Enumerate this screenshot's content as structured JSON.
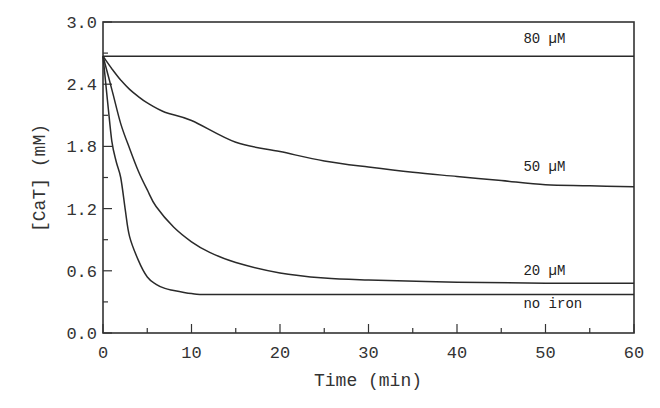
{
  "chart_data": {
    "type": "line",
    "title": "",
    "xlabel": "Time (min)",
    "ylabel": "[CaT] (mM)",
    "xlim": [
      0,
      60
    ],
    "ylim": [
      0.0,
      3.0
    ],
    "xticks": [
      0,
      10,
      20,
      30,
      40,
      50,
      60
    ],
    "xtick_labels": [
      "0",
      "10",
      "20",
      "30",
      "40",
      "50",
      "60"
    ],
    "xminor": [
      5,
      15,
      25,
      35,
      45,
      55
    ],
    "yticks": [
      0.0,
      0.6,
      1.2,
      1.8,
      2.4,
      3.0
    ],
    "ytick_labels": [
      "0.0",
      "0.6",
      "1.2",
      "1.8",
      "2.4",
      "3.0"
    ],
    "yminor": [
      0.3,
      0.9,
      1.5,
      2.1,
      2.7
    ],
    "grid": false,
    "legend": "inline labels at right",
    "series": [
      {
        "name": "80 µM",
        "x": [
          0,
          60
        ],
        "values": [
          2.67,
          2.67
        ]
      },
      {
        "name": "50 µM",
        "x": [
          0,
          1,
          2,
          3,
          4,
          5,
          7,
          10,
          15,
          20,
          25,
          30,
          35,
          40,
          45,
          50,
          55,
          60
        ],
        "values": [
          2.67,
          2.55,
          2.44,
          2.35,
          2.28,
          2.22,
          2.13,
          2.05,
          1.84,
          1.75,
          1.66,
          1.6,
          1.55,
          1.51,
          1.47,
          1.43,
          1.42,
          1.41
        ]
      },
      {
        "name": "20 µM",
        "x": [
          0,
          1,
          2,
          3,
          4,
          5,
          6,
          8,
          10,
          12,
          15,
          20,
          25,
          30,
          40,
          50,
          60
        ],
        "values": [
          2.67,
          2.35,
          2.02,
          1.78,
          1.56,
          1.38,
          1.22,
          1.02,
          0.88,
          0.78,
          0.68,
          0.58,
          0.53,
          0.51,
          0.49,
          0.48,
          0.48
        ]
      },
      {
        "name": "no iron",
        "x": [
          0,
          0.5,
          1,
          1.5,
          2,
          2.5,
          3,
          4,
          5,
          6,
          7,
          8,
          10,
          12,
          20,
          30,
          40,
          50,
          60
        ],
        "values": [
          2.67,
          2.25,
          1.85,
          1.65,
          1.5,
          1.2,
          0.93,
          0.7,
          0.54,
          0.47,
          0.43,
          0.41,
          0.38,
          0.37,
          0.37,
          0.37,
          0.37,
          0.37,
          0.37
        ]
      }
    ],
    "series_label_positions": [
      {
        "name": "80 µM",
        "x_min": 47.5,
        "y_val": 2.8
      },
      {
        "name": "50 µM",
        "x_min": 47.5,
        "y_val": 1.56
      },
      {
        "name": "20 µM",
        "x_min": 47.5,
        "y_val": 0.56
      },
      {
        "name": "no iron",
        "x_min": 47.5,
        "y_val": 0.24
      }
    ]
  }
}
